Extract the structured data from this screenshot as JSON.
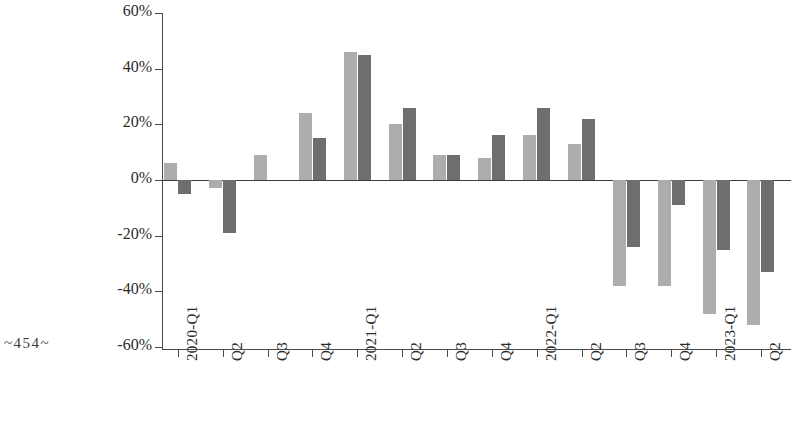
{
  "page": {
    "folio_marker": "~454~"
  },
  "chart_data": {
    "type": "bar",
    "title": "",
    "subtitle": "",
    "xlabel": "",
    "ylabel": "",
    "ylim": [
      -60,
      60
    ],
    "ytick_values": [
      60,
      40,
      20,
      0,
      -20,
      -40,
      -60
    ],
    "ytick_labels": [
      "60%",
      "40%",
      "20%",
      "0%",
      "-20%",
      "-40%",
      "-60%"
    ],
    "grid": false,
    "legend": "none",
    "orientation": "vertical",
    "grouping": "grouped",
    "categories": [
      "2020-Q1",
      "Q2",
      "Q3",
      "Q4",
      "2021-Q1",
      "Q2",
      "Q3",
      "Q4",
      "2022-Q1",
      "Q2",
      "Q3",
      "Q4",
      "2023-Q1",
      "Q2"
    ],
    "series": [
      {
        "name": "series-a",
        "color": "#adadad",
        "values": [
          6,
          -3,
          9,
          24,
          46,
          20,
          9,
          8,
          16,
          13,
          -38,
          -38,
          -48,
          -52
        ]
      },
      {
        "name": "series-b",
        "color": "#6e6e6e",
        "values": [
          -5,
          -19,
          0,
          15,
          45,
          26,
          9,
          16,
          26,
          22,
          -24,
          -9,
          -25,
          -33
        ]
      }
    ]
  }
}
